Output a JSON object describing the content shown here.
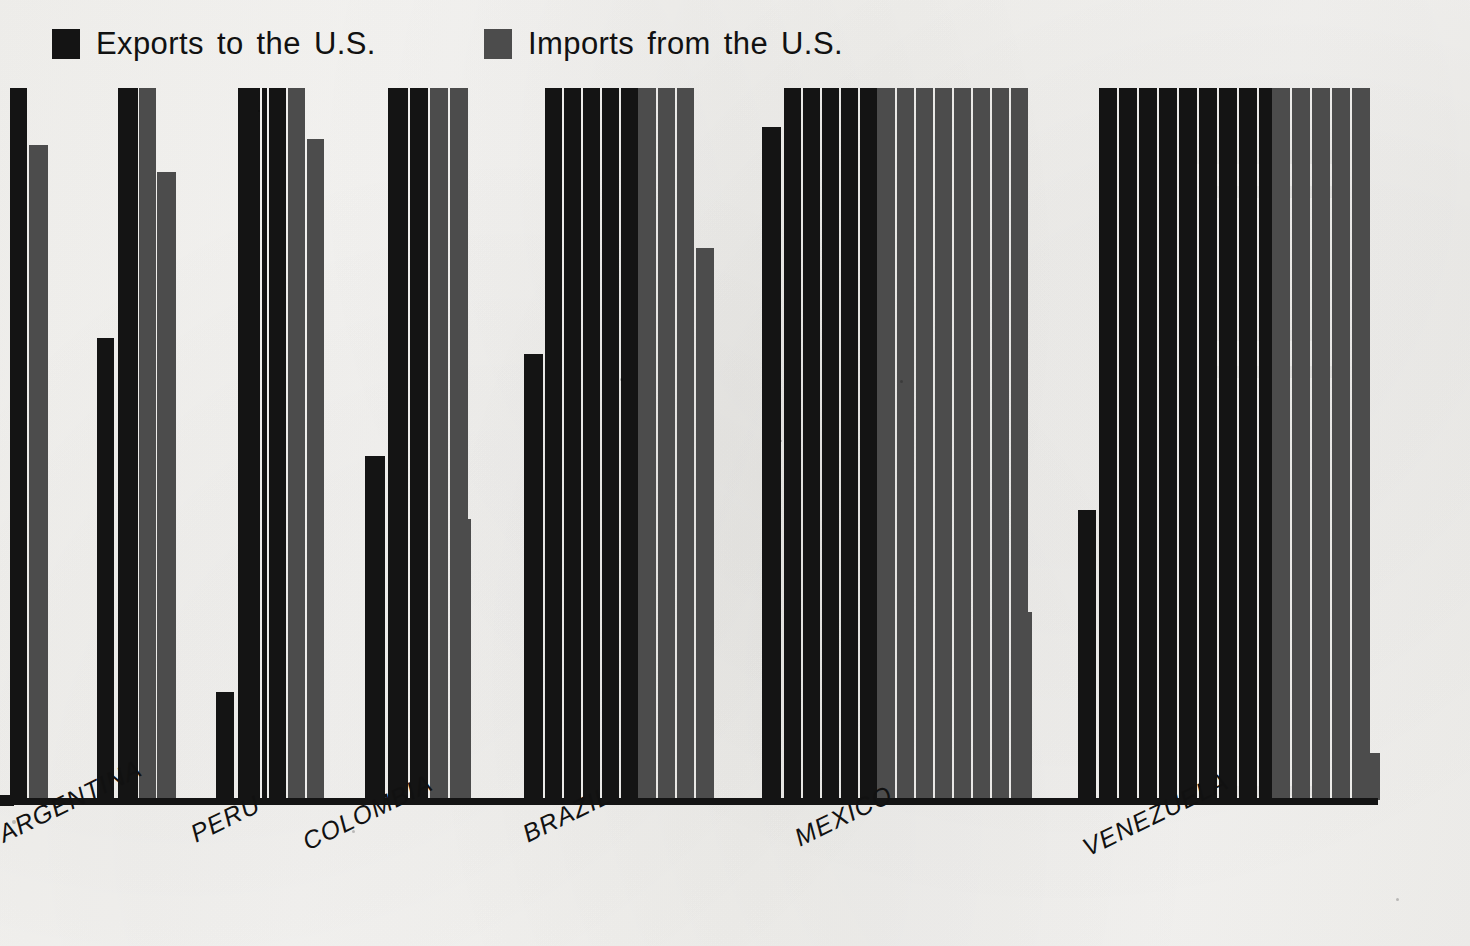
{
  "legend": {
    "exports": {
      "label": "Exports to the U.S.",
      "color": "#141414",
      "swatch": "legend-swatch-black"
    },
    "imports": {
      "label": "Imports from the U.S.",
      "color": "#4c4c4c",
      "swatch": "legend-swatch-gray"
    }
  },
  "axis": {
    "baseline_color": "#141414"
  },
  "background_color": "#f7f6f4",
  "chart_data": {
    "type": "bar",
    "title": "",
    "subtitle": "",
    "xlabel": "",
    "ylabel": "",
    "grid": false,
    "legend_position": "top-left",
    "orientation": "vertical",
    "note": "Scanned print. Bars are grouped by country; within each country a run of black 'Exports' bars is followed by a run of gray 'Imports' bars. Values are read as bar pixel heights normalized to the tallest bar (=100); many bars are clipped at the top of the frame.",
    "ylim": [
      0,
      100
    ],
    "categories": [
      "ARGENTINA",
      "PERU",
      "COLOMBIA",
      "BRAZIL",
      "MEXICO",
      "VENEZUELA"
    ],
    "series": [
      {
        "name": "Exports to the U.S.",
        "color": "#141414"
      },
      {
        "name": "Imports from the U.S.",
        "color": "#4c4c4c"
      }
    ],
    "groups": [
      {
        "category": "ARGENTINA",
        "bars": [
          {
            "series": "Exports to the U.S.",
            "value": 100
          },
          {
            "series": "Imports from the U.S.",
            "value": 92
          },
          {
            "series": "Exports to the U.S.",
            "value": 65
          }
        ]
      },
      {
        "category": "PERU",
        "bars": [
          {
            "series": "Exports to the U.S.",
            "value": 100
          },
          {
            "series": "Imports from the U.S.",
            "value": 100
          },
          {
            "series": "Imports from the U.S.",
            "value": 88
          },
          {
            "series": "Exports to the U.S.",
            "value": 16
          }
        ]
      },
      {
        "category": "COLOMBIA",
        "bars": [
          {
            "series": "Exports to the U.S.",
            "value": 100
          },
          {
            "series": "Exports to the U.S.",
            "value": 100
          },
          {
            "series": "Imports from the U.S.",
            "value": 100
          },
          {
            "series": "Imports from the U.S.",
            "value": 92
          },
          {
            "series": "Exports to the U.S.",
            "value": 49
          },
          {
            "series": "Imports from the U.S.",
            "value": 40
          }
        ]
      },
      {
        "category": "BRAZIL",
        "bars": [
          {
            "series": "Exports to the U.S.",
            "value": 100
          },
          {
            "series": "Exports to the U.S.",
            "value": 100
          },
          {
            "series": "Exports to the U.S.",
            "value": 100
          },
          {
            "series": "Exports to the U.S.",
            "value": 100
          },
          {
            "series": "Exports to the U.S.",
            "value": 100
          },
          {
            "series": "Imports from the U.S.",
            "value": 100
          },
          {
            "series": "Imports from the U.S.",
            "value": 100
          },
          {
            "series": "Imports from the U.S.",
            "value": 100
          },
          {
            "series": "Exports to the U.S.",
            "value": 63
          },
          {
            "series": "Imports from the U.S.",
            "value": 78
          }
        ]
      },
      {
        "category": "MEXICO",
        "bars": [
          {
            "series": "Exports to the U.S.",
            "value": 100
          },
          {
            "series": "Exports to the U.S.",
            "value": 100
          },
          {
            "series": "Exports to the U.S.",
            "value": 100
          },
          {
            "series": "Exports to the U.S.",
            "value": 100
          },
          {
            "series": "Exports to the U.S.",
            "value": 100
          },
          {
            "series": "Imports from the U.S.",
            "value": 100
          },
          {
            "series": "Imports from the U.S.",
            "value": 100
          },
          {
            "series": "Imports from the U.S.",
            "value": 100
          },
          {
            "series": "Imports from the U.S.",
            "value": 100
          },
          {
            "series": "Imports from the U.S.",
            "value": 100
          },
          {
            "series": "Imports from the U.S.",
            "value": 100
          },
          {
            "series": "Imports from the U.S.",
            "value": 100
          },
          {
            "series": "Imports from the U.S.",
            "value": 100
          },
          {
            "series": "Exports to the U.S.",
            "value": 94
          },
          {
            "series": "Imports from the U.S.",
            "value": 26
          }
        ]
      },
      {
        "category": "VENEZUELA",
        "bars": [
          {
            "series": "Exports to the U.S.",
            "value": 100
          },
          {
            "series": "Exports to the U.S.",
            "value": 100
          },
          {
            "series": "Exports to the U.S.",
            "value": 100
          },
          {
            "series": "Exports to the U.S.",
            "value": 100
          },
          {
            "series": "Exports to the U.S.",
            "value": 100
          },
          {
            "series": "Exports to the U.S.",
            "value": 100
          },
          {
            "series": "Exports to the U.S.",
            "value": 100
          },
          {
            "series": "Exports to the U.S.",
            "value": 100
          },
          {
            "series": "Exports to the U.S.",
            "value": 100
          },
          {
            "series": "Imports from the U.S.",
            "value": 100
          },
          {
            "series": "Imports from the U.S.",
            "value": 100
          },
          {
            "series": "Imports from the U.S.",
            "value": 100
          },
          {
            "series": "Imports from the U.S.",
            "value": 100
          },
          {
            "series": "Imports from the U.S.",
            "value": 100
          },
          {
            "series": "Exports to the U.S.",
            "value": 41
          },
          {
            "series": "Imports from the U.S.",
            "value": 7
          }
        ]
      }
    ]
  },
  "bar_layout": [
    {
      "x": 10,
      "w": 17,
      "top": 88,
      "series": "exports"
    },
    {
      "x": 29,
      "w": 19,
      "top": 145,
      "series": "imports"
    },
    {
      "x": 97,
      "w": 17,
      "top": 338,
      "series": "exports"
    },
    {
      "x": 118,
      "w": 20,
      "top": 88,
      "series": "exports"
    },
    {
      "x": 139,
      "w": 17,
      "top": 88,
      "series": "imports"
    },
    {
      "x": 157,
      "w": 19,
      "top": 172,
      "series": "imports"
    },
    {
      "x": 216,
      "w": 18,
      "top": 692,
      "series": "exports"
    },
    {
      "x": 238,
      "w": 22,
      "top": 88,
      "series": "exports"
    },
    {
      "x": 262,
      "w": 5,
      "top": 88,
      "series": "exports"
    },
    {
      "x": 269,
      "w": 17,
      "top": 88,
      "series": "exports"
    },
    {
      "x": 288,
      "w": 17,
      "top": 88,
      "series": "imports"
    },
    {
      "x": 307,
      "w": 17,
      "top": 139,
      "series": "imports"
    },
    {
      "x": 365,
      "w": 20,
      "top": 456,
      "series": "exports"
    },
    {
      "x": 388,
      "w": 20,
      "top": 88,
      "series": "exports"
    },
    {
      "x": 410,
      "w": 18,
      "top": 88,
      "series": "exports"
    },
    {
      "x": 430,
      "w": 18,
      "top": 88,
      "series": "imports"
    },
    {
      "x": 450,
      "w": 18,
      "top": 88,
      "series": "imports"
    },
    {
      "x": 453,
      "w": 0,
      "top": 88,
      "series": "imports"
    },
    {
      "x": 453,
      "w": 18,
      "top": 519,
      "series": "imports"
    },
    {
      "x": 524,
      "w": 19,
      "top": 354,
      "series": "exports"
    },
    {
      "x": 545,
      "w": 17,
      "top": 88,
      "series": "exports"
    },
    {
      "x": 564,
      "w": 17,
      "top": 88,
      "series": "exports"
    },
    {
      "x": 583,
      "w": 17,
      "top": 88,
      "series": "exports"
    },
    {
      "x": 602,
      "w": 17,
      "top": 88,
      "series": "exports"
    },
    {
      "x": 621,
      "w": 17,
      "top": 88,
      "series": "exports"
    },
    {
      "x": 638,
      "w": 18,
      "top": 88,
      "series": "imports"
    },
    {
      "x": 658,
      "w": 17,
      "top": 88,
      "series": "imports"
    },
    {
      "x": 677,
      "w": 17,
      "top": 88,
      "series": "imports"
    },
    {
      "x": 696,
      "w": 18,
      "top": 248,
      "series": "imports"
    },
    {
      "x": 762,
      "w": 19,
      "top": 127,
      "series": "exports"
    },
    {
      "x": 784,
      "w": 17,
      "top": 88,
      "series": "exports"
    },
    {
      "x": 803,
      "w": 17,
      "top": 88,
      "series": "exports"
    },
    {
      "x": 822,
      "w": 17,
      "top": 88,
      "series": "exports"
    },
    {
      "x": 841,
      "w": 17,
      "top": 88,
      "series": "exports"
    },
    {
      "x": 860,
      "w": 17,
      "top": 88,
      "series": "exports"
    },
    {
      "x": 877,
      "w": 18,
      "top": 88,
      "series": "imports"
    },
    {
      "x": 897,
      "w": 17,
      "top": 88,
      "series": "imports"
    },
    {
      "x": 916,
      "w": 17,
      "top": 88,
      "series": "imports"
    },
    {
      "x": 935,
      "w": 17,
      "top": 88,
      "series": "imports"
    },
    {
      "x": 954,
      "w": 17,
      "top": 88,
      "series": "imports"
    },
    {
      "x": 973,
      "w": 17,
      "top": 88,
      "series": "imports"
    },
    {
      "x": 992,
      "w": 17,
      "top": 88,
      "series": "imports"
    },
    {
      "x": 1011,
      "w": 17,
      "top": 88,
      "series": "imports"
    },
    {
      "x": 1014,
      "w": 0,
      "top": 88,
      "series": "imports"
    },
    {
      "x": 1014,
      "w": 18,
      "top": 612,
      "series": "imports"
    },
    {
      "x": 1078,
      "w": 18,
      "top": 510,
      "series": "exports"
    },
    {
      "x": 1099,
      "w": 18,
      "top": 88,
      "series": "exports"
    },
    {
      "x": 1119,
      "w": 18,
      "top": 88,
      "series": "exports"
    },
    {
      "x": 1139,
      "w": 18,
      "top": 88,
      "series": "exports"
    },
    {
      "x": 1159,
      "w": 18,
      "top": 88,
      "series": "exports"
    },
    {
      "x": 1179,
      "w": 18,
      "top": 88,
      "series": "exports"
    },
    {
      "x": 1199,
      "w": 18,
      "top": 88,
      "series": "exports"
    },
    {
      "x": 1219,
      "w": 18,
      "top": 88,
      "series": "exports"
    },
    {
      "x": 1239,
      "w": 18,
      "top": 88,
      "series": "exports"
    },
    {
      "x": 1259,
      "w": 18,
      "top": 88,
      "series": "exports"
    },
    {
      "x": 1272,
      "w": 18,
      "top": 88,
      "series": "imports"
    },
    {
      "x": 1292,
      "w": 18,
      "top": 88,
      "series": "imports"
    },
    {
      "x": 1312,
      "w": 18,
      "top": 88,
      "series": "imports"
    },
    {
      "x": 1332,
      "w": 18,
      "top": 88,
      "series": "imports"
    },
    {
      "x": 1352,
      "w": 18,
      "top": 88,
      "series": "imports"
    },
    {
      "x": 1360,
      "w": 20,
      "top": 753,
      "series": "imports"
    }
  ],
  "label_layout": [
    {
      "text": "ARGENTINA",
      "x": -6,
      "y": 22
    },
    {
      "text": "PERU",
      "x": 186,
      "y": 22
    },
    {
      "text": "COLOMBIA",
      "x": 298,
      "y": 30
    },
    {
      "text": "BRAZIL",
      "x": 518,
      "y": 22
    },
    {
      "text": "MEXICO",
      "x": 790,
      "y": 26
    },
    {
      "text": "VENEZUELA",
      "x": 1078,
      "y": 36
    }
  ]
}
